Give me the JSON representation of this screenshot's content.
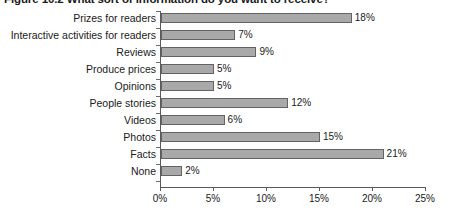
{
  "chart_data": {
    "type": "bar",
    "orientation": "horizontal",
    "title": "Figure 10.2 What sort of information do you want to receive?",
    "xlabel": "",
    "ylabel": "",
    "categories": [
      "Prizes for readers",
      "Interactive activities for readers",
      "Reviews",
      "Produce prices",
      "Opinions",
      "People stories",
      "Videos",
      "Photos",
      "Facts",
      "None"
    ],
    "values": [
      18,
      7,
      9,
      5,
      5,
      12,
      6,
      15,
      21,
      2
    ],
    "data_labels": [
      "18%",
      "7%",
      "9%",
      "5%",
      "5%",
      "12%",
      "6%",
      "15%",
      "21%",
      "2%"
    ],
    "xlim": [
      0,
      25
    ],
    "xticks": [
      0,
      5,
      10,
      15,
      20,
      25
    ],
    "xtick_labels": [
      "0%",
      "5%",
      "10%",
      "15%",
      "20%",
      "25%"
    ],
    "grid": false,
    "legend": null,
    "bar_color": "#a9a9a9",
    "bar_border_color": "#636363",
    "axis_color": "#5a5a5a",
    "text_color": "#1a1a1a"
  }
}
